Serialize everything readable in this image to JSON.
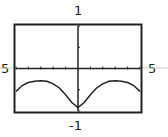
{
  "chart_data": {
    "type": "line",
    "title": "",
    "xlabel": "",
    "ylabel": "",
    "xlim": [
      -5,
      5
    ],
    "ylim": [
      -1,
      1
    ],
    "x_tick_step": 1,
    "y_tick_step": 0.5,
    "grid": false,
    "axis_labels": {
      "xmin": "5",
      "xmax": "5",
      "ymax": "1",
      "ymin": "-1"
    },
    "series": [
      {
        "name": "f(x)",
        "x": [
          -5,
          -4.5,
          -4,
          -3.5,
          -3,
          -2.5,
          -2,
          -1.5,
          -1,
          -0.5,
          0,
          0.5,
          1,
          1.5,
          2,
          2.5,
          3,
          3.5,
          4,
          4.5,
          5
        ],
        "y": [
          -0.54,
          -0.4,
          -0.33,
          -0.3,
          -0.29,
          -0.3,
          -0.36,
          -0.46,
          -0.62,
          -0.8,
          -0.92,
          -0.8,
          -0.62,
          -0.46,
          -0.36,
          -0.3,
          -0.29,
          -0.3,
          -0.33,
          -0.4,
          -0.54
        ]
      }
    ]
  }
}
